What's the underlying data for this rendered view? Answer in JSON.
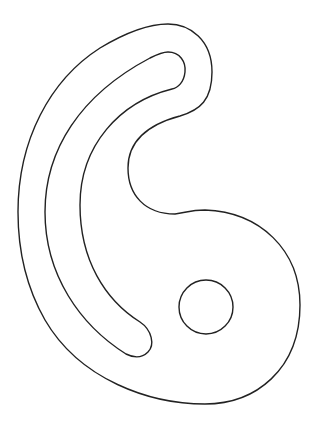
{
  "figure": {
    "stroke_color": "#222222",
    "background": "#ffffff",
    "parts": [
      {
        "name": "outer-outline"
      },
      {
        "name": "curved-slot"
      },
      {
        "name": "circular-hole"
      }
    ]
  }
}
